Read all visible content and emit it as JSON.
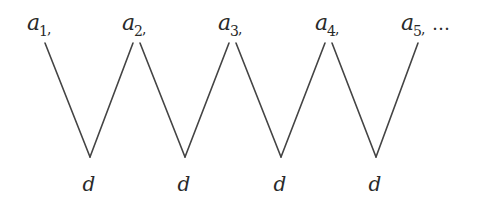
{
  "diagram": {
    "top_nodes": [
      {
        "base": "a",
        "sub": "1",
        "suffix": ",",
        "x": 27,
        "y": 30
      },
      {
        "base": "a",
        "sub": "2",
        "suffix": ",",
        "x": 122,
        "y": 30
      },
      {
        "base": "a",
        "sub": "3",
        "suffix": ",",
        "x": 218,
        "y": 30
      },
      {
        "base": "a",
        "sub": "4",
        "suffix": ",",
        "x": 315,
        "y": 30
      },
      {
        "base": "a",
        "sub": "5",
        "suffix": ",",
        "x": 400,
        "y": 30
      }
    ],
    "ellipsis": "…",
    "bottom_nodes": [
      {
        "label": "d",
        "x": 89,
        "y": 191
      },
      {
        "label": "d",
        "x": 184,
        "y": 191
      },
      {
        "label": "d",
        "x": 280,
        "y": 191
      },
      {
        "label": "d",
        "x": 375,
        "y": 191
      }
    ],
    "edges": [
      [
        45,
        43,
        90,
        157
      ],
      [
        90,
        157,
        133,
        43
      ],
      [
        140,
        43,
        185,
        157
      ],
      [
        185,
        157,
        229,
        43
      ],
      [
        236,
        43,
        281,
        157
      ],
      [
        281,
        157,
        325,
        43
      ],
      [
        332,
        43,
        376,
        157
      ],
      [
        376,
        157,
        418,
        43
      ]
    ],
    "line_color": "#444444"
  }
}
